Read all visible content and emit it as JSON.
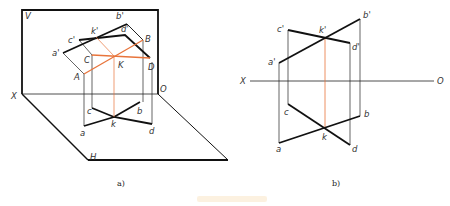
{
  "figure": {
    "subfigure_labels": {
      "left": "a)",
      "right": "b)"
    },
    "colors": {
      "line": "#111111",
      "thin": "#222222",
      "highlight": "#e8743b",
      "label": "#333333"
    }
  },
  "left_diagram": {
    "plane_labels": {
      "vertical": "V",
      "horizontal": "H",
      "axis_x": "X",
      "axis_o": "O"
    },
    "points_upper": {
      "a_prime": "a'",
      "b_prime": "b'",
      "c_prime": "c'",
      "d_prime": "d'",
      "k_prime": "k'"
    },
    "points_space": {
      "A": "A",
      "B": "B",
      "C": "C",
      "D": "D",
      "K": "K"
    },
    "points_lower": {
      "a": "a",
      "b": "b",
      "c": "c",
      "d": "d",
      "k": "k"
    }
  },
  "right_diagram": {
    "axis": {
      "x": "X",
      "o": "O"
    },
    "points_upper": {
      "a_prime": "a'",
      "b_prime": "b'",
      "c_prime": "c'",
      "d_prime": "d'",
      "k_prime": "k'"
    },
    "points_lower": {
      "a": "a",
      "b": "b",
      "c": "c",
      "d": "d",
      "k": "k"
    }
  }
}
